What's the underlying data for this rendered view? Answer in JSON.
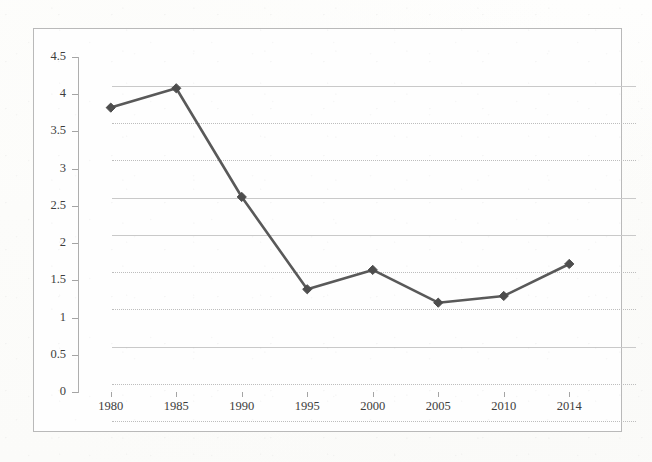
{
  "chart_data": {
    "type": "line",
    "title": "",
    "subtitle": "",
    "xlabel": "",
    "ylabel": "",
    "categories": [
      "1980",
      "1985",
      "1990",
      "1995",
      "2000",
      "2005",
      "2010",
      "2014"
    ],
    "values": [
      3.82,
      4.08,
      2.62,
      1.38,
      1.64,
      1.2,
      1.29,
      1.72
    ],
    "series": [
      {
        "name": "",
        "values": [
          3.82,
          4.08,
          2.62,
          1.38,
          1.64,
          1.2,
          1.29,
          1.72
        ]
      }
    ],
    "ylim": [
      0,
      4.5
    ],
    "ytick_labels": [
      "0",
      "0.5",
      "1",
      "1.5",
      "2",
      "2.5",
      "3",
      "3.5",
      "4",
      "4.5"
    ],
    "ytick_values": [
      0,
      0.5,
      1,
      1.5,
      2,
      2.5,
      3,
      3.5,
      4,
      4.5
    ],
    "xtick_labels": [
      "1980",
      "1985",
      "1990",
      "1995",
      "2000",
      "2005",
      "2010",
      "2014"
    ],
    "grid": "horizontal",
    "legend": "none",
    "marker": "diamond",
    "annotations": []
  },
  "style": {
    "line_color": "#595959",
    "marker_color": "#4d4d4d",
    "grid_color": "#c9c9c9",
    "axis_color": "#a4a4a4",
    "frame_color": "#b9b9b9",
    "text_color": "#3d3d3d",
    "plot_background": "#fefefe",
    "page_background": "#fdfdfc"
  }
}
